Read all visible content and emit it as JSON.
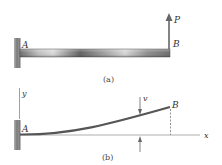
{
  "figure_a": {
    "caption": "(a)",
    "label_fixed_end": "A",
    "label_free_end": "B",
    "load_label": "P"
  },
  "figure_b": {
    "caption": "(b)",
    "label_fixed_end": "A",
    "label_free_end": "B",
    "axis_x_label": "x",
    "axis_y_label": "y",
    "deflection_label": "v"
  },
  "colors": {
    "wall": "#8a8a8a",
    "beam_dark": "#5a5a5a",
    "beam_light": "#d8d8d8",
    "curve": "#555555",
    "axis": "#888888",
    "arrow": "#666666"
  }
}
